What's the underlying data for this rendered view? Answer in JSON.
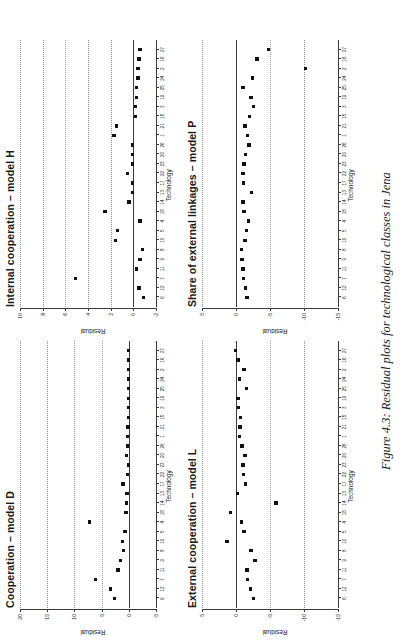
{
  "caption": "Figure 4.3: Residual plots for technological classes in Jena",
  "axis": {
    "xlabel": "Technology",
    "ylabel": "Residual"
  },
  "chart_data": [
    {
      "type": "scatter",
      "panel_id": "model-d",
      "title": "Cooperation – model D",
      "xlabel": "Technology",
      "ylabel": "Residual",
      "xlim": [
        0,
        28
      ],
      "ylim": [
        -5,
        20
      ],
      "yticks": [
        -5,
        0,
        5,
        10,
        15,
        20
      ],
      "grid": true,
      "zero_line": 0,
      "categories": [
        "6",
        "12",
        "7",
        "11",
        "9",
        "8",
        "10",
        "5",
        "4",
        "18",
        "14",
        "13",
        "17",
        "22",
        "23",
        "20",
        "26",
        "1",
        "21",
        "15",
        "3",
        "19",
        "25",
        "24",
        "2",
        "16",
        "27"
      ],
      "x": [
        1,
        2,
        3,
        4,
        5,
        6,
        7,
        8,
        9,
        10,
        11,
        12,
        13,
        14,
        15,
        16,
        17,
        18,
        19,
        20,
        21,
        22,
        23,
        24,
        25,
        26,
        27
      ],
      "values": [
        2.6,
        3.4,
        6.1,
        2.0,
        1.5,
        1.0,
        1.2,
        0.7,
        7.2,
        0.5,
        0.4,
        0.3,
        1.1,
        0.2,
        0.1,
        0.4,
        0.2,
        0.2,
        0.15,
        0.1,
        0.1,
        0.1,
        0.05,
        0.05,
        0.05,
        0.05,
        0.05
      ]
    },
    {
      "type": "scatter",
      "panel_id": "model-h",
      "title": "Internal cooperation – model H",
      "xlabel": "Technology",
      "ylabel": "Residual",
      "xlim": [
        0,
        28
      ],
      "ylim": [
        -2,
        10
      ],
      "yticks": [
        -2,
        0,
        2,
        4,
        6,
        8,
        10
      ],
      "grid": true,
      "zero_line": 0,
      "categories": [
        "6",
        "12",
        "7",
        "11",
        "9",
        "8",
        "10",
        "5",
        "4",
        "18",
        "14",
        "13",
        "17",
        "22",
        "23",
        "20",
        "26",
        "1",
        "21",
        "15",
        "3",
        "19",
        "25",
        "24",
        "2",
        "16",
        "27"
      ],
      "x": [
        1,
        2,
        3,
        4,
        5,
        6,
        7,
        8,
        9,
        10,
        11,
        12,
        13,
        14,
        15,
        16,
        17,
        18,
        19,
        20,
        21,
        22,
        23,
        24,
        25,
        26,
        27
      ],
      "values": [
        -0.9,
        -0.5,
        5.1,
        -0.3,
        -0.6,
        -0.8,
        1.6,
        1.4,
        -0.6,
        2.5,
        0.4,
        0.05,
        0.1,
        0.5,
        0.05,
        0.05,
        0.05,
        1.7,
        1.5,
        -0.2,
        -0.2,
        -0.3,
        -0.3,
        -0.4,
        -0.4,
        -0.5,
        -0.6
      ]
    },
    {
      "type": "scatter",
      "panel_id": "model-p",
      "title": "Share of external linkages – model P",
      "xlabel": "Technology",
      "ylabel": "Residual",
      "xlim": [
        0,
        28
      ],
      "ylim": [
        -15,
        5
      ],
      "yticks": [
        -15,
        -10,
        -5,
        0,
        5
      ],
      "grid": true,
      "zero_line": 0,
      "categories": [
        "6",
        "12",
        "7",
        "11",
        "9",
        "8",
        "10",
        "5",
        "4",
        "18",
        "14",
        "13",
        "17",
        "22",
        "23",
        "20",
        "26",
        "1",
        "21",
        "15",
        "3",
        "19",
        "25",
        "24",
        "2",
        "16",
        "27"
      ],
      "x": [
        1,
        2,
        3,
        4,
        5,
        6,
        7,
        8,
        9,
        10,
        11,
        12,
        13,
        14,
        15,
        16,
        17,
        18,
        19,
        20,
        21,
        22,
        23,
        24,
        25,
        26,
        27
      ],
      "values": [
        -1.6,
        -1.4,
        -1.1,
        -1.0,
        -0.9,
        -0.85,
        -1.3,
        -1.5,
        -1.8,
        -1.2,
        -1.0,
        -2.3,
        -1.1,
        -1.0,
        -1.2,
        -1.4,
        -1.9,
        -1.7,
        -1.3,
        -2.0,
        -2.6,
        -2.2,
        -1.0,
        -2.4,
        -10.2,
        -3.1,
        -4.8
      ]
    },
    {
      "type": "scatter",
      "panel_id": "model-l",
      "title": "External cooperation – model L",
      "xlabel": "Technology",
      "ylabel": "Residual",
      "xlim": [
        0,
        28
      ],
      "ylim": [
        -15,
        5
      ],
      "yticks": [
        -15,
        -10,
        -5,
        0,
        5
      ],
      "grid": true,
      "zero_line": 0,
      "categories": [
        "6",
        "12",
        "7",
        "11",
        "9",
        "8",
        "10",
        "5",
        "4",
        "18",
        "14",
        "13",
        "17",
        "22",
        "23",
        "20",
        "26",
        "1",
        "21",
        "15",
        "3",
        "19",
        "25",
        "24",
        "2",
        "16",
        "27"
      ],
      "x": [
        1,
        2,
        3,
        4,
        5,
        6,
        7,
        8,
        9,
        10,
        11,
        12,
        13,
        14,
        15,
        16,
        17,
        18,
        19,
        20,
        21,
        22,
        23,
        24,
        25,
        26,
        27
      ],
      "values": [
        -2.6,
        -2.1,
        -1.7,
        -1.6,
        -2.8,
        -2.2,
        1.3,
        -1.2,
        -0.8,
        0.8,
        -5.9,
        -0.2,
        -1.4,
        -1.1,
        -1.0,
        -1.3,
        -0.9,
        -0.5,
        -0.6,
        -0.7,
        -0.4,
        -0.3,
        -1.5,
        -0.5,
        -1.2,
        -0.3,
        0.1
      ]
    }
  ]
}
